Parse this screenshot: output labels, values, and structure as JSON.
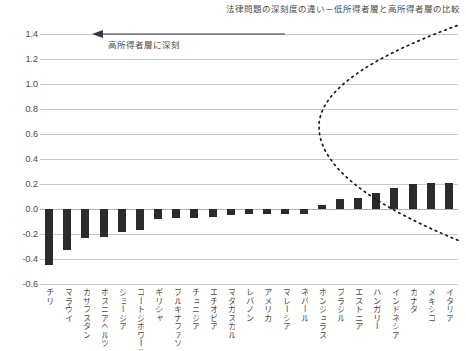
{
  "chart_data": {
    "type": "bar",
    "title": "法律問題の深刻度の違い－低所得者層と高所得者層の比較",
    "xlabel": "",
    "ylabel": "",
    "ylim": [
      -0.6,
      1.4
    ],
    "ytick_step": 0.2,
    "grid": true,
    "legend": "none",
    "yticks": [
      "1.4",
      "1.2",
      "1.0",
      "0.8",
      "0.6",
      "0.4",
      "0.2",
      "0.0",
      "-0.2",
      "-0.4",
      "-0.6"
    ],
    "categories": [
      "チリ",
      "マラウイ",
      "カザフスタン",
      "ボスニアヘルツェゴビナ",
      "ジョージア",
      "コートジボワール",
      "ギリシャ",
      "ブルキナファソ",
      "チュニジア",
      "エチオピア",
      "マダガスカル",
      "レバノン",
      "アメリカ",
      "マレーシア",
      "ネパール",
      "ホンジュラス",
      "ブラジル",
      "エストニア",
      "ハンガリー",
      "インドネシア",
      "カナダ",
      "メキシコ",
      "イタリア"
    ],
    "values": [
      -0.45,
      -0.33,
      -0.23,
      -0.22,
      -0.18,
      -0.17,
      -0.08,
      -0.07,
      -0.07,
      -0.06,
      -0.05,
      -0.04,
      -0.04,
      -0.04,
      -0.04,
      0.03,
      0.08,
      0.09,
      0.13,
      0.17,
      0.2,
      0.21,
      0.21
    ],
    "annotations": [
      {
        "name": "high-income-more-severe",
        "text": "高所得者層に深刻",
        "arrow": "left",
        "at_y": 1.4
      }
    ],
    "overlay_curve": {
      "name": "confidence-envelope",
      "style": "dotted",
      "color": "#1a1a1a",
      "description": "sideways parabola opening rightward, vertex near category index 14.8 at y=0.66"
    }
  }
}
